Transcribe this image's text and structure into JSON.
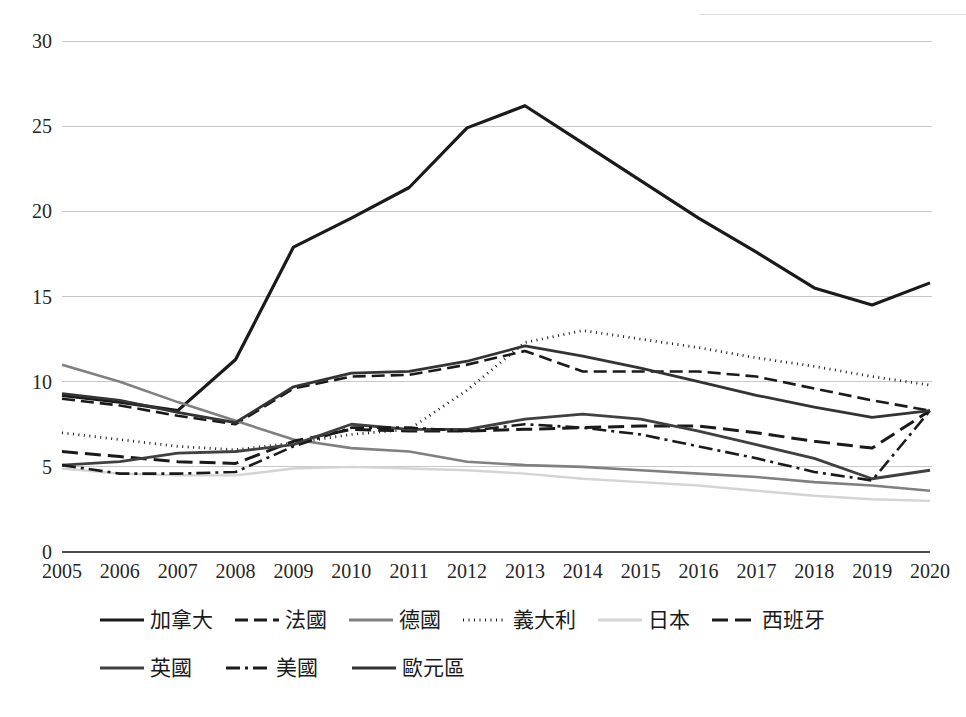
{
  "chart_data": {
    "type": "line",
    "title": "",
    "subtitle": "",
    "xlabel": "",
    "ylabel": "",
    "categories": [
      "2005",
      "2006",
      "2007",
      "2008",
      "2009",
      "2010",
      "2011",
      "2012",
      "2013",
      "2014",
      "2015",
      "2016",
      "2017",
      "2018",
      "2019",
      "2020"
    ],
    "x": [
      2005,
      2006,
      2007,
      2008,
      2009,
      2010,
      2011,
      2012,
      2013,
      2014,
      2015,
      2016,
      2017,
      2018,
      2019,
      2020
    ],
    "ylim": [
      0,
      30
    ],
    "y_ticks": [
      0,
      5,
      10,
      15,
      20,
      25,
      30
    ],
    "y_tick_labels": [
      "0",
      "5",
      "10",
      "15",
      "20",
      "25",
      "30"
    ],
    "grid": true,
    "grid_axis": "y",
    "legend_position": "bottom",
    "series": [
      {
        "name": "加拿大",
        "key": "canada",
        "style": "solid",
        "color": "#1a1a1a",
        "width": 3.2,
        "dash": "",
        "values": [
          9.2,
          8.8,
          8.3,
          11.3,
          17.9,
          19.6,
          21.4,
          24.9,
          26.2,
          24.0,
          21.8,
          19.6,
          17.6,
          15.5,
          14.5,
          15.8
        ]
      },
      {
        "name": "法國",
        "key": "france",
        "style": "dashed",
        "color": "#1a1a1a",
        "width": 2.6,
        "dash": "13,6",
        "values": [
          9.0,
          8.6,
          8.0,
          7.5,
          9.6,
          10.3,
          10.4,
          11.0,
          11.8,
          10.6,
          10.6,
          10.6,
          10.3,
          9.6,
          8.9,
          8.3
        ]
      },
      {
        "name": "德國",
        "key": "germany",
        "style": "solid",
        "color": "#808080",
        "width": 2.6,
        "dash": "",
        "values": [
          11.0,
          10.0,
          8.8,
          7.7,
          6.6,
          6.1,
          5.9,
          5.3,
          5.1,
          5.0,
          4.8,
          4.6,
          4.4,
          4.1,
          3.9,
          3.6
        ]
      },
      {
        "name": "義大利",
        "key": "italy",
        "style": "dotted",
        "color": "#1a1a1a",
        "width": 2.8,
        "dash": "1,4.5",
        "values": [
          7.0,
          6.6,
          6.2,
          6.0,
          6.4,
          6.9,
          7.2,
          9.5,
          12.3,
          13.0,
          12.5,
          12.0,
          11.4,
          10.9,
          10.3,
          9.8
        ]
      },
      {
        "name": "日本",
        "key": "japan",
        "style": "solid",
        "color": "#d4d4d4",
        "width": 2.4,
        "dash": "",
        "values": [
          4.9,
          4.6,
          4.5,
          4.5,
          4.9,
          5.0,
          4.9,
          4.8,
          4.6,
          4.3,
          4.1,
          3.9,
          3.6,
          3.3,
          3.1,
          3.0
        ]
      },
      {
        "name": "西班牙",
        "key": "spain",
        "style": "dashed-thick",
        "color": "#1a1a1a",
        "width": 3.0,
        "dash": "16,7",
        "values": [
          5.9,
          5.6,
          5.3,
          5.2,
          6.5,
          7.2,
          7.1,
          7.1,
          7.2,
          7.3,
          7.4,
          7.4,
          7.0,
          6.5,
          6.1,
          8.3
        ]
      },
      {
        "name": "英國",
        "key": "uk",
        "style": "solid",
        "color": "#404040",
        "width": 2.8,
        "dash": "",
        "values": [
          5.1,
          5.3,
          5.8,
          5.9,
          6.3,
          7.5,
          7.2,
          7.2,
          7.8,
          8.1,
          7.8,
          7.1,
          6.3,
          5.5,
          4.3,
          4.8
        ]
      },
      {
        "name": "美國",
        "key": "usa",
        "style": "dash-dot",
        "color": "#1a1a1a",
        "width": 2.6,
        "dash": "14,5,3,5",
        "values": [
          5.1,
          4.6,
          4.6,
          4.7,
          6.2,
          7.3,
          7.3,
          7.1,
          7.5,
          7.3,
          6.9,
          6.2,
          5.5,
          4.7,
          4.2,
          8.3
        ]
      },
      {
        "name": "歐元區",
        "key": "eurozone",
        "style": "solid",
        "color": "#333333",
        "width": 2.8,
        "dash": "",
        "values": [
          9.3,
          8.9,
          8.2,
          7.6,
          9.7,
          10.5,
          10.6,
          11.2,
          12.1,
          11.5,
          10.8,
          10.0,
          9.2,
          8.5,
          7.9,
          8.3
        ]
      }
    ]
  },
  "legend": {
    "row1": [
      "加拿大",
      "法國",
      "德國",
      "義大利",
      "日本",
      "西班牙"
    ],
    "row2": [
      "英國",
      "美國",
      "歐元區"
    ]
  },
  "axes": {
    "y_labels": [
      "30",
      "25",
      "20",
      "15",
      "10",
      "5",
      "0"
    ],
    "x_labels": [
      "2005",
      "2006",
      "2007",
      "2008",
      "2009",
      "2010",
      "2011",
      "2012",
      "2013",
      "2014",
      "2015",
      "2016",
      "2017",
      "2018",
      "2019",
      "2020"
    ]
  }
}
